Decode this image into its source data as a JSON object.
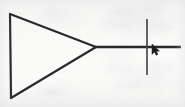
{
  "canvas": {
    "width": 185,
    "height": 107,
    "media": "scanned hand-drawn sketch on paper",
    "background_color": "#fbfbfa",
    "ink_color": "#2b2b2f",
    "caption": "Hand-drawn triangle pointing right with a horizontal line from its apex crossed by a vertical line; mouse cursor near the crossing"
  },
  "shapes": {
    "triangle": {
      "label": "triangle",
      "description": "right-pointing triangle (arrowhead / amplifier symbol), open outline",
      "stroke_color": "#2b2b2f",
      "stroke_width": 2.2,
      "points": "10,14 96,47 11,98",
      "vertices": [
        {
          "name": "top-left",
          "x": 10,
          "y": 14
        },
        {
          "name": "apex-right",
          "x": 96,
          "y": 47
        },
        {
          "name": "bottom-left",
          "x": 11,
          "y": 98
        }
      ]
    },
    "horizontal_line": {
      "label": "horizontal line",
      "description": "line running right from the triangle apex to the right edge",
      "stroke_color": "#2b2b2f",
      "stroke_width": 2.4,
      "x1": 95,
      "y1": 47,
      "x2": 181,
      "y2": 47
    },
    "vertical_line": {
      "label": "vertical line",
      "description": "vertical line crossing the horizontal line",
      "stroke_color": "#4a4a50",
      "stroke_width": 1.7,
      "x1": 147,
      "y1": 19,
      "x2": 147,
      "y2": 75
    },
    "left_edge": {
      "label": "triangle left edge",
      "description": "vertical back edge of the triangle",
      "stroke_color": "#2b2b2f",
      "stroke_width": 2.2,
      "x1": 10,
      "y1": 14,
      "x2": 11,
      "y2": 98
    }
  },
  "cursor": {
    "label": "mouse pointer",
    "type": "arrow-pointer",
    "color": "#1d1d21",
    "x": 152,
    "y": 44,
    "width": 7,
    "height": 11
  },
  "annotations": {
    "visible_text": "",
    "note": "no legible text present; faint gray blotches are paper bleed-through"
  }
}
